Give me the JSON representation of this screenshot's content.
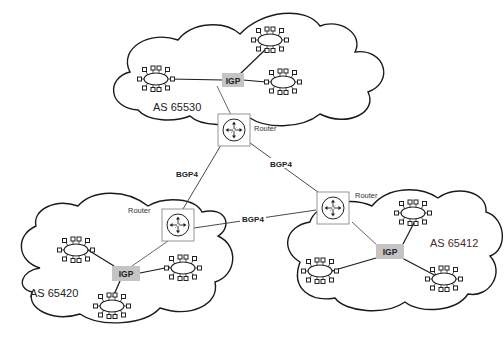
{
  "diagram": {
    "autonomous_systems": [
      {
        "id": "as1",
        "label": "AS 65530",
        "igp_label": "IGP"
      },
      {
        "id": "as2",
        "label": "AS 65420",
        "igp_label": "IGP"
      },
      {
        "id": "as3",
        "label": "AS 65412",
        "igp_label": "IGP"
      }
    ],
    "routers": [
      {
        "id": "r1",
        "label": "Router"
      },
      {
        "id": "r2",
        "label": "Router"
      },
      {
        "id": "r3",
        "label": "Router"
      }
    ],
    "bgp_links": [
      {
        "from": "r1",
        "to": "r2",
        "label": "BGP4"
      },
      {
        "from": "r1",
        "to": "r3",
        "label": "BGP4"
      },
      {
        "from": "r2",
        "to": "r3",
        "label": "BGP4"
      }
    ],
    "colors": {
      "igp_box": "#c4c4c4",
      "line": "#1a1a1a",
      "router_border": "#8a8a8a"
    }
  }
}
